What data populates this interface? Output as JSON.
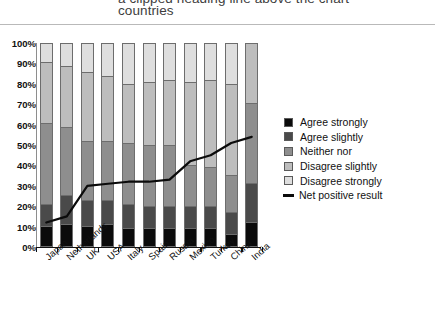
{
  "title": {
    "line1": "a clipped heading line above the chart",
    "line2": "countries"
  },
  "chart_data": {
    "type": "bar",
    "subtype": "stacked-bar-100-percent-with-line-overlay",
    "title": "countries",
    "xlabel": "",
    "ylabel": "",
    "ylim": [
      0,
      100
    ],
    "ytick_labels": [
      "0%",
      "10%",
      "20%",
      "30%",
      "40%",
      "50%",
      "60%",
      "70%",
      "80%",
      "90%",
      "100%"
    ],
    "ytick_values": [
      0,
      10,
      20,
      30,
      40,
      50,
      60,
      70,
      80,
      90,
      100
    ],
    "grid": false,
    "legend_position": "right",
    "categories": [
      "Japan",
      "Netherlands",
      "UK",
      "USA",
      "Italy",
      "Spain",
      "Russia",
      "Mexico",
      "Turkey",
      "China",
      "India"
    ],
    "series": [
      {
        "name": "Agree strongly",
        "color": "#0b0b0b",
        "values": [
          10,
          11,
          10,
          11,
          9,
          9,
          9,
          9,
          9,
          6,
          12
        ]
      },
      {
        "name": "Agree slightly",
        "color": "#4a4a4a",
        "values": [
          11,
          14,
          13,
          12,
          12,
          11,
          11,
          11,
          11,
          11,
          19
        ]
      },
      {
        "name": "Neither nor",
        "color": "#8e8e8e",
        "values": [
          40,
          34,
          29,
          29,
          30,
          30,
          30,
          20,
          19,
          18,
          40
        ]
      },
      {
        "name": "Disagree slightly",
        "color": "#bdbdbd",
        "values": [
          30,
          30,
          34,
          32,
          29,
          31,
          32,
          41,
          43,
          45,
          29
        ]
      },
      {
        "name": "Disagree strongly",
        "color": "#dedede",
        "values": [
          9,
          11,
          14,
          16,
          20,
          19,
          18,
          19,
          18,
          20,
          0
        ]
      }
    ],
    "overlay_line": {
      "name": "Net positive result",
      "color": "#0b0b0b",
      "values": [
        12,
        15,
        30,
        31,
        32,
        32,
        33,
        42,
        45,
        51,
        54
      ]
    }
  },
  "legend": {
    "items": [
      {
        "label": "Agree strongly",
        "swatch_class": "s0",
        "type": "swatch"
      },
      {
        "label": "Agree slightly",
        "swatch_class": "s1",
        "type": "swatch"
      },
      {
        "label": "Neither nor",
        "swatch_class": "s2",
        "type": "swatch"
      },
      {
        "label": "Disagree slightly",
        "swatch_class": "s3",
        "type": "swatch"
      },
      {
        "label": "Disagree strongly",
        "swatch_class": "s4",
        "type": "swatch"
      },
      {
        "label": "Net positive result",
        "swatch_class": "line",
        "type": "line"
      }
    ]
  }
}
